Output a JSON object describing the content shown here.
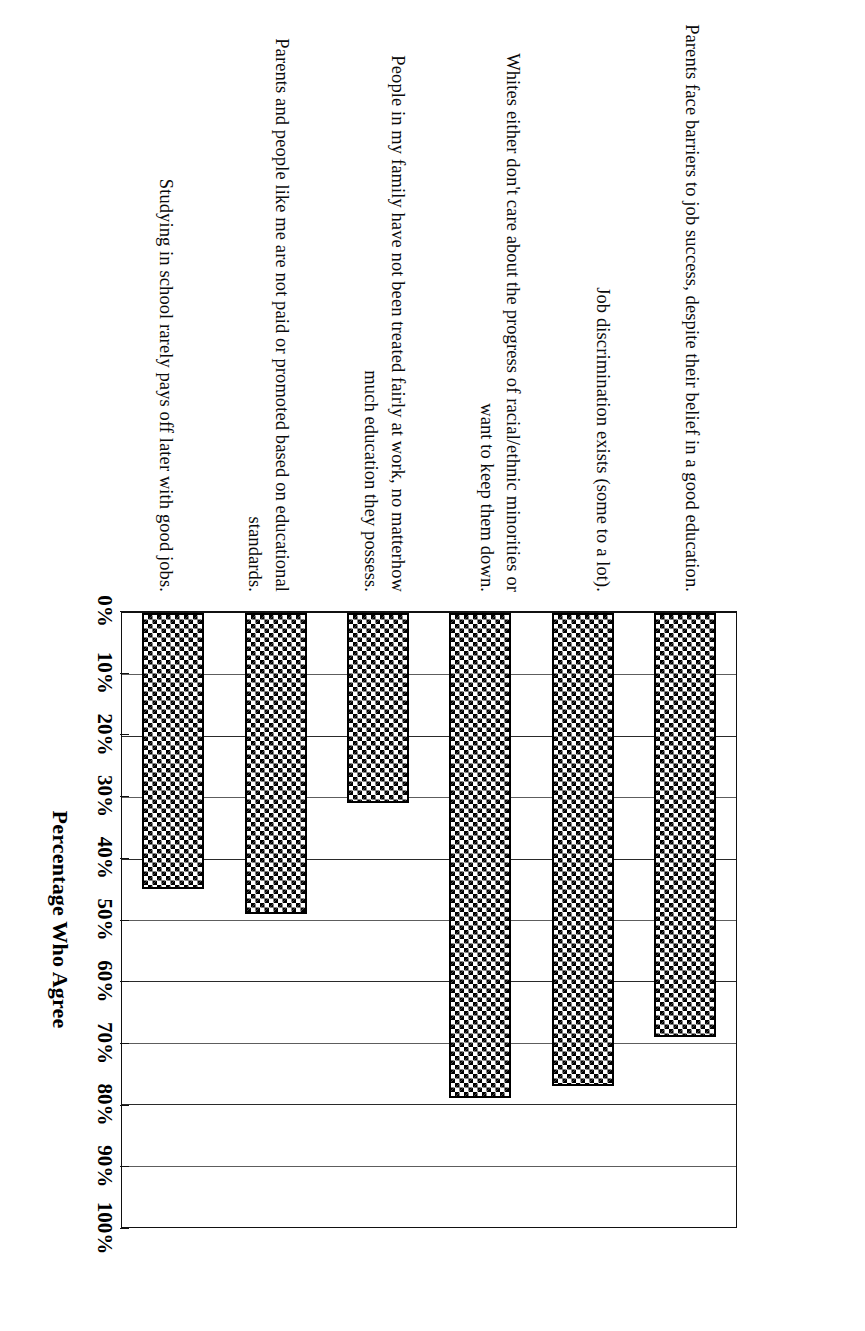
{
  "chart_data": {
    "type": "bar",
    "orientation": "horizontal",
    "title": "",
    "subtitle": "",
    "xlabel": "Percentage Who Agree",
    "ylabel": "",
    "xlim": [
      0,
      100
    ],
    "grid": true,
    "legend": null,
    "value_suffix": "%",
    "categories": [
      "Parents face barriers to job success, despite their belief in a good education.",
      "Job discrimination exists (some to a lot).",
      "Whites either don't care about the progress of racial/ethnic minorities or want to keep them down.",
      "People in my family have not been treated fairly at work, no matterhow much education they possess.",
      "Parents and people like me are not paid or promoted based on educational standards.",
      "Studying in school rarely pays off later with good jobs."
    ],
    "values": [
      69,
      77,
      79,
      31,
      49,
      45
    ],
    "tick_labels": [
      "0%",
      "10%",
      "20%",
      "30%",
      "40%",
      "50%",
      "60%",
      "70%",
      "80%",
      "90%",
      "100%"
    ],
    "tick_values": [
      0,
      10,
      20,
      30,
      40,
      50,
      60,
      70,
      80,
      90,
      100
    ],
    "colors": {
      "bar_fill": "#000000",
      "bar_outline": "#000000",
      "gridline": "#5d5d5d",
      "axis": "#111111",
      "background": "#ffffff",
      "text": "#000000"
    }
  },
  "axis": {
    "title": "Percentage Who Agree"
  }
}
